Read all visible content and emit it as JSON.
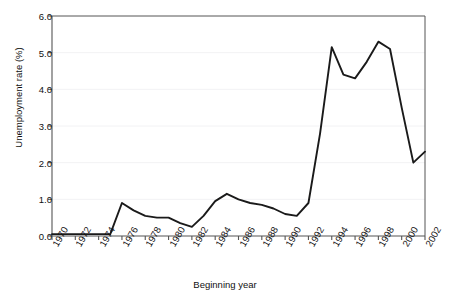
{
  "figure": {
    "clipped_header_text": "· · · · ·",
    "background_color": "#ffffff",
    "line_color": "#1a1a1a",
    "axis_color": "#555555",
    "grid_color": "#f2f2f4"
  },
  "chart_data": {
    "type": "line",
    "title": "",
    "xlabel": "Beginning year",
    "ylabel": "Unemployment rate (%)",
    "xlim": [
      1970,
      2002
    ],
    "ylim": [
      0.0,
      6.0
    ],
    "grid": true,
    "legend": null,
    "ytick_labels": [
      "0.0",
      "1.0",
      "2.0",
      "3.0",
      "4.0",
      "5.0",
      "6.0"
    ],
    "ytick_values": [
      0.0,
      1.0,
      2.0,
      3.0,
      4.0,
      5.0,
      6.0
    ],
    "xtick_labels": [
      "1970",
      "1972",
      "1974",
      "1976",
      "1978",
      "1980",
      "1982",
      "1984",
      "1986",
      "1988",
      "1990",
      "1992",
      "1994",
      "1996",
      "1998",
      "2000",
      "2002"
    ],
    "xtick_values": [
      1970,
      1972,
      1974,
      1976,
      1978,
      1980,
      1982,
      1984,
      1986,
      1988,
      1990,
      1992,
      1994,
      1996,
      1998,
      2000,
      2002
    ],
    "x": [
      1970,
      1971,
      1972,
      1973,
      1974,
      1975,
      1976,
      1977,
      1978,
      1979,
      1980,
      1981,
      1982,
      1983,
      1984,
      1985,
      1986,
      1987,
      1988,
      1989,
      1990,
      1991,
      1992,
      1993,
      1994,
      1995,
      1996,
      1997,
      1998,
      1999,
      2000,
      2001,
      2002
    ],
    "values": [
      0.05,
      0.05,
      0.05,
      0.05,
      0.05,
      0.05,
      0.9,
      0.7,
      0.55,
      0.5,
      0.5,
      0.35,
      0.25,
      0.55,
      0.95,
      1.15,
      1.0,
      0.9,
      0.85,
      0.75,
      0.6,
      0.55,
      0.9,
      2.8,
      5.15,
      4.4,
      4.3,
      4.75,
      5.3,
      5.1,
      3.5,
      2.0,
      2.3
    ],
    "series_name": "Unemployment rate"
  }
}
